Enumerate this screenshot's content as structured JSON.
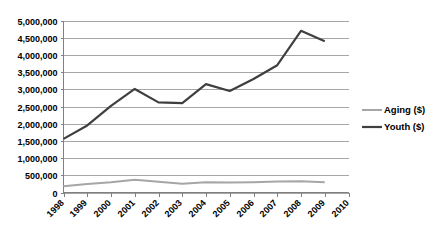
{
  "chart_data": {
    "type": "line",
    "title": "",
    "subtitle": "",
    "xlabel": "",
    "ylabel": "",
    "x": [
      1998,
      1999,
      2000,
      2001,
      2002,
      2003,
      2004,
      2005,
      2006,
      2007,
      2008,
      2009,
      2010
    ],
    "categories": [
      "1998",
      "1999",
      "2000",
      "2001",
      "2002",
      "2003",
      "2004",
      "2005",
      "2006",
      "2007",
      "2008",
      "2009",
      "2010"
    ],
    "xlim": [
      1998,
      2010
    ],
    "ylim": [
      0,
      5000000
    ],
    "ytick_values": [
      0,
      500000,
      1000000,
      1500000,
      2000000,
      2500000,
      3000000,
      3500000,
      4000000,
      4500000,
      5000000
    ],
    "ytick_labels": [
      "0",
      "500,000",
      "1,000,000",
      "1,500,000",
      "2,000,000",
      "2,500,000",
      "3,000,000",
      "3,500,000",
      "4,000,000",
      "4,500,000",
      "5,000,000"
    ],
    "grid": true,
    "grid_axis": "y",
    "legend_position": "right",
    "series": [
      {
        "name": "Aging ($)",
        "color": "#a6a6a6",
        "line_width": 2,
        "x": [
          1998,
          1999,
          2000,
          2001,
          2002,
          2003,
          2004,
          2005,
          2006,
          2007,
          2008,
          2009
        ],
        "values": [
          180000,
          250000,
          300000,
          370000,
          310000,
          255000,
          300000,
          290000,
          300000,
          320000,
          330000,
          300000
        ]
      },
      {
        "name": "Youth ($)",
        "color": "#3f3f3f",
        "line_width": 2.2,
        "x": [
          1998,
          1999,
          2000,
          2001,
          2002,
          2003,
          2004,
          2005,
          2006,
          2007,
          2008,
          2009
        ],
        "values": [
          1560000,
          1950000,
          2520000,
          3010000,
          2620000,
          2600000,
          3150000,
          2950000,
          3300000,
          3700000,
          4700000,
          4400000
        ]
      }
    ],
    "annotations": []
  },
  "legend": {
    "entries": [
      {
        "label": "Aging ($)"
      },
      {
        "label": "Youth ($)"
      }
    ]
  }
}
